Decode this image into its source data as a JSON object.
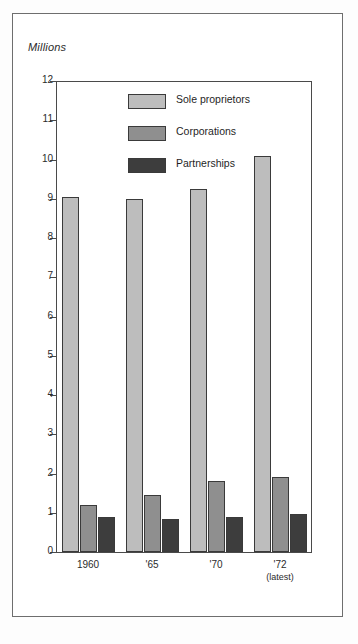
{
  "figure": {
    "units_label": "Millions"
  },
  "legend": {
    "position": "inside-top-center",
    "items": [
      {
        "label": "Sole proprietors",
        "color": "#bdbdbd",
        "swatch": "legend-swatch-sole-proprietors"
      },
      {
        "label": "Corporations",
        "color": "#8f8f8f",
        "swatch": "legend-swatch-corporations"
      },
      {
        "label": "Partnerships",
        "color": "#3d3d3d",
        "swatch": "legend-swatch-partnerships"
      }
    ]
  },
  "axes": {
    "y_ticks": [
      "0",
      "1",
      "2",
      "3",
      "4",
      "5",
      "6",
      "7",
      "8",
      "9",
      "10",
      "11",
      "12"
    ],
    "x_labels": [
      {
        "main": "1960",
        "sub": ""
      },
      {
        "main": "'65",
        "sub": ""
      },
      {
        "main": "'70",
        "sub": ""
      },
      {
        "main": "'72",
        "sub": "(latest)"
      }
    ]
  },
  "chart_data": {
    "type": "bar",
    "title": "",
    "subtitle": "",
    "xlabel": "",
    "ylabel": "Millions",
    "ylim": [
      0,
      12
    ],
    "yticks": [
      0,
      1,
      2,
      3,
      4,
      5,
      6,
      7,
      8,
      9,
      10,
      11,
      12
    ],
    "grid": false,
    "legend_position": "inside-top-center",
    "categories": [
      "1960",
      "'65",
      "'70",
      "'72 (latest)"
    ],
    "series": [
      {
        "name": "Sole proprietors",
        "color": "#bdbdbd",
        "values": [
          9.05,
          9.0,
          9.25,
          10.1
        ]
      },
      {
        "name": "Corporations",
        "color": "#8f8f8f",
        "values": [
          1.2,
          1.45,
          1.8,
          1.9
        ]
      },
      {
        "name": "Partnerships",
        "color": "#3d3d3d",
        "values": [
          0.9,
          0.85,
          0.88,
          0.97
        ]
      }
    ]
  }
}
